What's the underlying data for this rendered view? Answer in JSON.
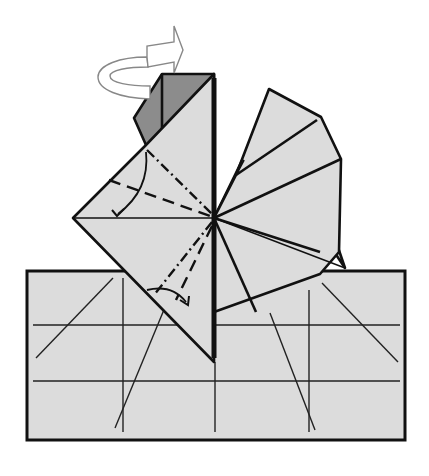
{
  "diagram": {
    "type": "origami-step",
    "colors": {
      "background": "#ffffff",
      "paper": "#dcdcdc",
      "paper_dark": "#8c8c8c",
      "line": "#111111",
      "arrow_fill": "#ffffff",
      "arrow_stroke": "#888888"
    },
    "symbols": [
      {
        "name": "turn-over-arrow",
        "meaning": "turn the model over"
      },
      {
        "name": "valley-fold-arrow",
        "meaning": "fold in direction of arrow"
      },
      {
        "name": "mountain-fold-line",
        "meaning": "dash-dot crease"
      },
      {
        "name": "valley-fold-line",
        "meaning": "dashed crease"
      }
    ],
    "shapes": {
      "base_rectangle": {
        "x": 27,
        "y": 271,
        "w": 378,
        "h": 169
      },
      "center_point": [
        214,
        218
      ],
      "bottom_tip": [
        215,
        362
      ],
      "left_point": [
        73,
        218
      ]
    }
  }
}
